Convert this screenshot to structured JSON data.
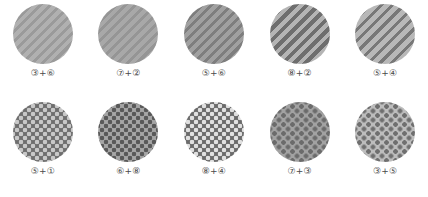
{
  "figure": {
    "rows": [
      {
        "row_name": "striped-texture-row",
        "pattern_type": "diagonal-stripes",
        "cells": [
          {
            "label": "③+⑥",
            "icon_name": "striped-circle-swatch",
            "base_color": "#b0b0b0",
            "stripe_color": "#9a9a9a",
            "stripe_width": 3,
            "stripe_gap": 4,
            "angle": 45
          },
          {
            "label": "⑦+②",
            "icon_name": "striped-circle-swatch",
            "base_color": "#a8a8a8",
            "stripe_color": "#959595",
            "stripe_width": 3,
            "stripe_gap": 4,
            "angle": 45
          },
          {
            "label": "⑤+⑥",
            "icon_name": "striped-circle-swatch",
            "base_color": "#a0a0a0",
            "stripe_color": "#7e7e7e",
            "stripe_width": 3,
            "stripe_gap": 4,
            "angle": 45
          },
          {
            "label": "⑧+②",
            "icon_name": "striped-circle-swatch",
            "base_color": "#b4b4b4",
            "stripe_color": "#6e6e6e",
            "stripe_width": 4,
            "stripe_gap": 4,
            "angle": 45
          },
          {
            "label": "⑤+④",
            "icon_name": "striped-circle-swatch",
            "base_color": "#b8b8b8",
            "stripe_color": "#787878",
            "stripe_width": 3,
            "stripe_gap": 5,
            "angle": 45
          }
        ]
      },
      {
        "row_name": "dotted-texture-row",
        "pattern_type": "dot-grid",
        "cells": [
          {
            "label": "⑤+①",
            "icon_name": "dotted-circle-swatch",
            "base_color": "#6e6e6e",
            "dot_color": "#c8c8c8",
            "dot_size": 2,
            "dot_spacing": 8
          },
          {
            "label": "⑥+⑧",
            "icon_name": "dotted-circle-swatch",
            "base_color": "#a6a6a6",
            "dot_color": "#595959",
            "dot_size": 2,
            "dot_spacing": 8
          },
          {
            "label": "⑧+④",
            "icon_name": "dotted-circle-swatch",
            "base_color": "#6a6a6a",
            "dot_color": "#e0e0e0",
            "dot_size": 2,
            "dot_spacing": 8
          },
          {
            "label": "⑦+③",
            "icon_name": "dotted-circle-swatch",
            "base_color": "#a2a2a2",
            "dot_color": "#6b6b6b",
            "dot_size": 2,
            "dot_spacing": 9
          },
          {
            "label": "③+⑤",
            "icon_name": "dotted-circle-swatch",
            "base_color": "#bdbdbd",
            "dot_color": "#6f6f6f",
            "dot_size": 2,
            "dot_spacing": 9
          }
        ]
      }
    ]
  }
}
